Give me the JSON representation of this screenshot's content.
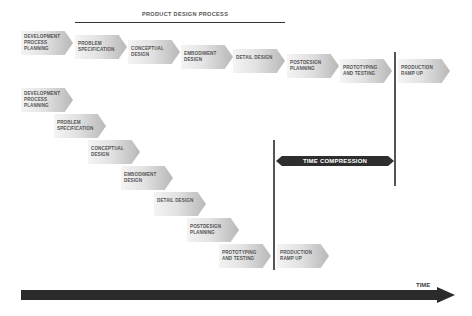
{
  "header": {
    "title": "PRODUCT DESIGN PROCESS"
  },
  "sequential_row": [
    {
      "label": "DEVELOPMENT PROCESS PLANNING"
    },
    {
      "label": "PROBLEM SPECIFICATION"
    },
    {
      "label": "CONCEPTUAL DESIGN"
    },
    {
      "label": "EMBODIMENT DESIGN"
    },
    {
      "label": "DETAIL DESIGN"
    },
    {
      "label": "POSTDESIGN PLANNING"
    },
    {
      "label": "PROTOTYPING AND TESTING"
    },
    {
      "label": "PRODUCTION RAMP UP"
    }
  ],
  "concurrent_row": [
    {
      "label": "DEVELOPMENT PROCESS PLANNING"
    },
    {
      "label": "PROBLEM SPECIFICATION"
    },
    {
      "label": "CONCEPTUAL DESIGN"
    },
    {
      "label": "EMBODIMENT DESIGN"
    },
    {
      "label": "DETAIL DESIGN"
    },
    {
      "label": "POSTDESIGN PLANNING"
    },
    {
      "label": "PROTOTYPING AND TESTING"
    },
    {
      "label": "PRODUCTION RAMP UP"
    }
  ],
  "time_compression": {
    "label": "TIME COMPRESSION"
  },
  "time_axis": {
    "label": "TIME"
  },
  "colors": {
    "box_light": "#f4f4f4",
    "box_dark": "#b8b8b8",
    "dark_arrow": "#2b2b2b",
    "text": "#555555"
  }
}
